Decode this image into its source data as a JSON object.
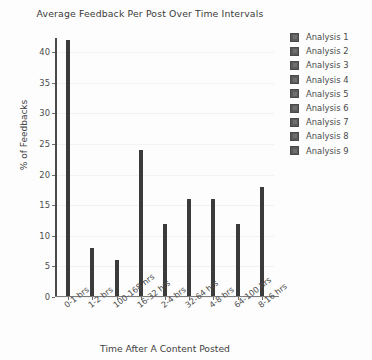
{
  "chart_data": {
    "type": "bar",
    "title": "Average Feedback Per Post Over Time Intervals",
    "xlabel": "Time After A Content Posted",
    "ylabel": "% of Feedbacks",
    "categories": [
      "0-1 hrs",
      "1-2 hrs",
      "100-168 hrs",
      "16-32 hrs",
      "2-4 hrs",
      "32-64 hrs",
      "4-8 hrs",
      "64-100 hrs",
      "8-16 hrs"
    ],
    "values": [
      42,
      8,
      6,
      24,
      12,
      16,
      16,
      12,
      18
    ],
    "ylim": [
      0,
      42
    ],
    "yticks": [
      0,
      5,
      10,
      15,
      20,
      25,
      30,
      35,
      40
    ],
    "ytick_labels": [
      "0",
      "5",
      "10",
      "15",
      "20",
      "25",
      "30",
      "35",
      "40"
    ],
    "grid": true,
    "legend_position": "right",
    "legend_entries": [
      "Analysis 1",
      "Analysis 2",
      "Analysis 3",
      "Analysis 4",
      "Analysis 5",
      "Analysis 6",
      "Analysis 7",
      "Analysis 8",
      "Analysis 9"
    ],
    "bar_color": "#3b3b3b",
    "legend_swatch_color": "#5a5a5a",
    "text_color": "#4a4a4a",
    "background_color": "#fdfdfd",
    "gridline_color": "#f2f2f2"
  }
}
